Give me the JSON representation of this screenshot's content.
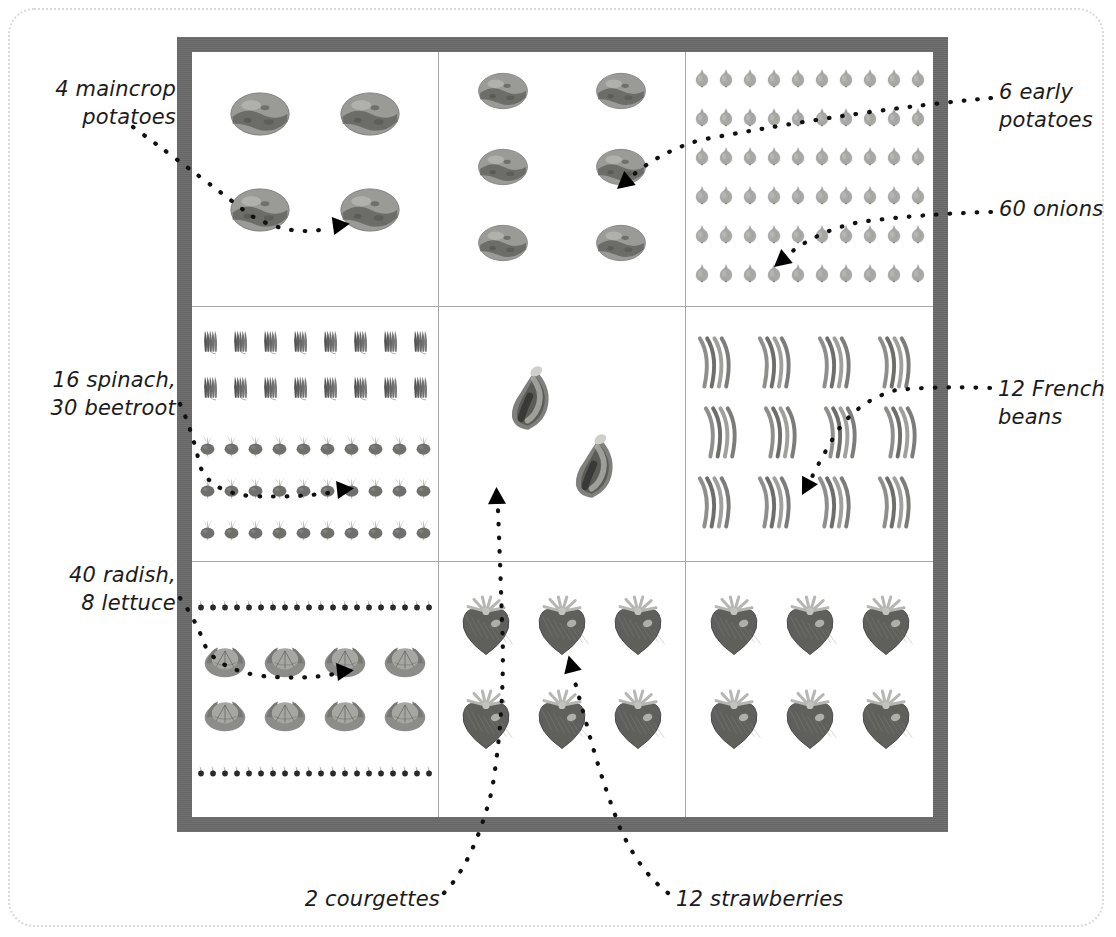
{
  "page": {
    "frame_color": "#6a6a6a",
    "grid_line_color": "#a8a8a8",
    "background": "#ffffff",
    "border_style": "dotted rounded"
  },
  "labels": [
    {
      "id": "maincrop-potatoes",
      "text": "4 maincrop\npotatoes",
      "align": "right",
      "x": 26,
      "y": 76,
      "width": 150
    },
    {
      "id": "early-potatoes",
      "text": "6 early\npotatoes",
      "align": "left",
      "x": 999,
      "y": 79,
      "width": 115
    },
    {
      "id": "onions",
      "text": "60 onions",
      "align": "left",
      "x": 999,
      "y": 196,
      "width": 115
    },
    {
      "id": "spinach-beetroot",
      "text": "16 spinach,\n30 beetroot",
      "align": "right",
      "x": 14,
      "y": 367,
      "width": 162
    },
    {
      "id": "french-beans",
      "text": "12 French\nbeans",
      "align": "left",
      "x": 998,
      "y": 376,
      "width": 118
    },
    {
      "id": "radish-lettuce",
      "text": "40 radish,\n8 lettuce",
      "align": "right",
      "x": 26,
      "y": 562,
      "width": 150
    },
    {
      "id": "courgettes",
      "text": "2 courgettes",
      "align": "right",
      "x": 270,
      "y": 886,
      "width": 170
    },
    {
      "id": "strawberries",
      "text": "12 strawberries",
      "align": "left",
      "x": 676,
      "y": 886,
      "width": 200
    }
  ],
  "cells": [
    {
      "id": "cell-maincrop-potatoes",
      "crop": "maincrop potatoes",
      "count": 4,
      "icon": "potato",
      "layout": {
        "rows": 2,
        "cols": 2,
        "icon_w": 88,
        "icon_h": 62,
        "gap_x": 22,
        "gap_y": 34
      }
    },
    {
      "id": "cell-early-potatoes",
      "crop": "early potatoes",
      "count": 6,
      "icon": "potato",
      "layout": {
        "rows": 3,
        "cols": 2,
        "icon_w": 72,
        "icon_h": 52,
        "gap_x": 46,
        "gap_y": 24
      }
    },
    {
      "id": "cell-onions",
      "crop": "onions",
      "count": 60,
      "icon": "onion",
      "layout": {
        "rows": 6,
        "cols": 10,
        "icon_w": 20,
        "icon_h": 32,
        "gap_x": 4,
        "gap_y": 7
      }
    },
    {
      "id": "cell-spinach-beetroot",
      "crop": "spinach and beetroot",
      "count": 46,
      "groups": [
        {
          "crop": "spinach",
          "count": 16,
          "icon": "spinach",
          "rows": 2,
          "cols": 8,
          "icon_w": 28,
          "icon_h": 44,
          "gap_x": 2,
          "gap_y": 2
        },
        {
          "crop": "beetroot",
          "count": 30,
          "icon": "beetroot",
          "rows": 3,
          "cols": 10,
          "icon_w": 23,
          "icon_h": 42,
          "gap_x": 1,
          "gap_y": 0
        }
      ]
    },
    {
      "id": "cell-courgettes",
      "crop": "courgettes",
      "count": 2,
      "icon": "courgette",
      "layout": {
        "rows": 1,
        "cols": 2,
        "icon_w": 64,
        "icon_h": 200,
        "gap_x": 6,
        "gap_y": 0
      }
    },
    {
      "id": "cell-french-beans",
      "crop": "French beans",
      "count": 12,
      "icon": "bean-cluster",
      "layout": {
        "rows": 3,
        "cols": 4,
        "icon_w": 56,
        "icon_h": 68,
        "gap_x": 4,
        "gap_y": 2
      }
    },
    {
      "id": "cell-radish-lettuce",
      "crop": "radish and lettuce",
      "count": 48,
      "groups": [
        {
          "crop": "radish",
          "count": 20,
          "icon": "radish",
          "rows": 2,
          "cols": 20,
          "icon_w": 12,
          "icon_h": 26,
          "gap_x": 0,
          "gap_y": 2
        },
        {
          "crop": "lettuce",
          "count": 8,
          "icon": "lettuce",
          "rows": 2,
          "cols": 4,
          "icon_w": 48,
          "icon_h": 44,
          "gap_x": 12,
          "gap_y": 10
        },
        {
          "crop": "radish",
          "count": 20,
          "icon": "radish",
          "rows": 2,
          "cols": 20,
          "icon_w": 12,
          "icon_h": 26,
          "gap_x": 0,
          "gap_y": 2
        }
      ]
    },
    {
      "id": "cell-strawberries-left",
      "crop": "strawberries",
      "count": 6,
      "icon": "strawberry",
      "layout": {
        "rows": 2,
        "cols": 3,
        "icon_w": 60,
        "icon_h": 62,
        "gap_x": 16,
        "gap_y": 32
      }
    },
    {
      "id": "cell-strawberries-right",
      "crop": "strawberries",
      "count": 6,
      "icon": "strawberry",
      "layout": {
        "rows": 2,
        "cols": 3,
        "icon_w": 60,
        "icon_h": 62,
        "gap_x": 16,
        "gap_y": 32
      }
    }
  ],
  "chart_data": {
    "type": "pictogram",
    "categories": [
      "maincrop potatoes",
      "early potatoes",
      "onions",
      "spinach",
      "beetroot",
      "courgettes",
      "French beans",
      "radish",
      "lettuce",
      "strawberries"
    ],
    "values": [
      4,
      6,
      60,
      16,
      30,
      2,
      12,
      40,
      8,
      12
    ],
    "xlabel": "",
    "ylabel": "number of plants",
    "legend": "none",
    "grid": true
  }
}
